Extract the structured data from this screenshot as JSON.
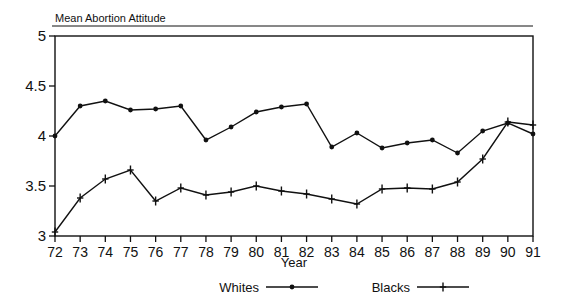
{
  "chart_data": {
    "type": "line",
    "title": "Mean Abortion Attitude",
    "xlabel": "Year",
    "ylabel": "",
    "x": [
      72,
      73,
      74,
      75,
      76,
      77,
      78,
      79,
      80,
      81,
      82,
      83,
      84,
      85,
      86,
      87,
      88,
      89,
      90,
      91
    ],
    "xticklabels": [
      "72",
      "73",
      "74",
      "75",
      "76",
      "77",
      "78",
      "79",
      "80",
      "81",
      "82",
      "83",
      "84",
      "85",
      "86",
      "87",
      "88",
      "89",
      "90",
      "91"
    ],
    "yticklabels": [
      "3",
      "3.5",
      "4",
      "4.5",
      "5"
    ],
    "ytickvalues": [
      3,
      3.5,
      4,
      4.5,
      5
    ],
    "xlim": [
      72,
      91
    ],
    "ylim": [
      3,
      5
    ],
    "grid": false,
    "legend_position": "below-axes",
    "series": [
      {
        "name": "Whites",
        "marker": "filled-circle",
        "values": [
          4.0,
          4.3,
          4.35,
          4.26,
          4.27,
          4.3,
          3.96,
          4.09,
          4.24,
          4.29,
          4.32,
          3.89,
          4.03,
          3.88,
          3.93,
          3.96,
          3.83,
          4.05,
          4.13,
          4.02
        ]
      },
      {
        "name": "Blacks",
        "marker": "plus-cross",
        "values": [
          3.04,
          3.38,
          3.57,
          3.66,
          3.35,
          3.48,
          3.41,
          3.44,
          3.5,
          3.45,
          3.42,
          3.37,
          3.32,
          3.47,
          3.48,
          3.47,
          3.54,
          3.77,
          4.14,
          4.11
        ]
      }
    ]
  },
  "legend": {
    "entries": [
      {
        "label": "Whites",
        "marker": "filled-circle"
      },
      {
        "label": "Blacks",
        "marker": "plus-cross"
      }
    ]
  }
}
